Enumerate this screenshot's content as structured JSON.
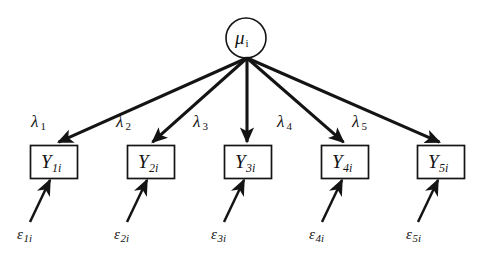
{
  "diagram": {
    "type": "path-diagram",
    "title": "",
    "background_color": "#ffffff",
    "stroke_color": "#141414",
    "latent_variable": {
      "symbol": "μ",
      "subscript": "i",
      "shape": "circle",
      "cx": 246,
      "cy": 38,
      "r": 20
    },
    "indicators": [
      {
        "symbol": "Y",
        "subscript": "1i",
        "shape": "rectangle",
        "x": 30,
        "y": 145,
        "w": 48,
        "h": 34
      },
      {
        "symbol": "Y",
        "subscript": "2i",
        "shape": "rectangle",
        "x": 127,
        "y": 145,
        "w": 48,
        "h": 34
      },
      {
        "symbol": "Y",
        "subscript": "3i",
        "shape": "rectangle",
        "x": 224,
        "y": 145,
        "w": 48,
        "h": 34
      },
      {
        "symbol": "Y",
        "subscript": "4i",
        "shape": "rectangle",
        "x": 321,
        "y": 145,
        "w": 48,
        "h": 34
      },
      {
        "symbol": "Y",
        "subscript": "5i",
        "shape": "rectangle",
        "x": 417,
        "y": 145,
        "w": 48,
        "h": 34
      }
    ],
    "loadings": [
      {
        "symbol": "λ",
        "subscript": "1",
        "x": 31,
        "y": 112
      },
      {
        "symbol": "λ",
        "subscript": "2",
        "x": 116,
        "y": 112
      },
      {
        "symbol": "λ",
        "subscript": "3",
        "x": 193,
        "y": 112
      },
      {
        "symbol": "λ",
        "subscript": "4",
        "x": 277,
        "y": 112
      },
      {
        "symbol": "λ",
        "subscript": "5",
        "x": 352,
        "y": 112
      }
    ],
    "errors": [
      {
        "symbol": "ε",
        "subscript": "1i",
        "x": 17,
        "y": 226
      },
      {
        "symbol": "ε",
        "subscript": "2i",
        "x": 114,
        "y": 226
      },
      {
        "symbol": "ε",
        "subscript": "3i",
        "x": 211,
        "y": 226
      },
      {
        "symbol": "ε",
        "subscript": "4i",
        "x": 309,
        "y": 226
      },
      {
        "symbol": "ε",
        "subscript": "5i",
        "x": 406,
        "y": 226
      }
    ],
    "loading_arrows": [
      {
        "from": [
          247,
          58
        ],
        "to": [
          57,
          143
        ]
      },
      {
        "from": [
          247,
          58
        ],
        "to": [
          152,
          143
        ]
      },
      {
        "from": [
          247,
          58
        ],
        "to": [
          247,
          143
        ]
      },
      {
        "from": [
          247,
          58
        ],
        "to": [
          344,
          143
        ]
      },
      {
        "from": [
          247,
          58
        ],
        "to": [
          440,
          143
        ]
      }
    ],
    "error_arrows": [
      {
        "from": [
          30,
          222
        ],
        "to": [
          50,
          181
        ]
      },
      {
        "from": [
          127,
          222
        ],
        "to": [
          147,
          181
        ]
      },
      {
        "from": [
          224,
          222
        ],
        "to": [
          244,
          181
        ]
      },
      {
        "from": [
          322,
          222
        ],
        "to": [
          342,
          181
        ]
      },
      {
        "from": [
          418,
          222
        ],
        "to": [
          438,
          181
        ]
      }
    ]
  }
}
